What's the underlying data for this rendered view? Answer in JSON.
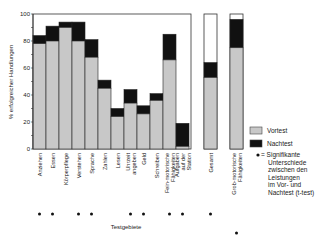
{
  "chart_data": {
    "type": "bar",
    "stacked": true,
    "title": "",
    "xlabel": "Testgebiete",
    "ylabel": "% erfolgreicher Handlungen",
    "ylim": [
      0,
      100
    ],
    "yticks": [
      0,
      20,
      40,
      60,
      80,
      100
    ],
    "grid": false,
    "categories": [
      {
        "label": [
          "Anziehen"
        ],
        "significant": true,
        "group": "main"
      },
      {
        "label": [
          "Essen"
        ],
        "significant": true,
        "group": "main"
      },
      {
        "label": [
          "Körperpflege"
        ],
        "significant": false,
        "group": "main"
      },
      {
        "label": [
          "Verstehen"
        ],
        "significant": true,
        "group": "main"
      },
      {
        "label": [
          "Sprache"
        ],
        "significant": true,
        "group": "main"
      },
      {
        "label": [
          "Zahlen"
        ],
        "significant": false,
        "group": "main"
      },
      {
        "label": [
          "Lesen"
        ],
        "significant": false,
        "group": "main"
      },
      {
        "label": [
          "Uhrzeit",
          "angeben"
        ],
        "significant": true,
        "group": "main"
      },
      {
        "label": [
          "Geld"
        ],
        "significant": true,
        "group": "main"
      },
      {
        "label": [
          "Schreiben"
        ],
        "significant": false,
        "group": "main"
      },
      {
        "label": [
          "Fein-motorische",
          "Fähigkeiten"
        ],
        "significant": true,
        "group": "main"
      },
      {
        "label": [
          "Aufgaben",
          "auf der",
          "Station"
        ],
        "significant": true,
        "group": "main"
      },
      {
        "label": [
          "Gesamt"
        ],
        "significant": true,
        "group": "gesamt"
      },
      {
        "label": [
          "Grob-motorische",
          "Fähigkeiten"
        ],
        "significant": true,
        "group": "grob"
      }
    ],
    "series": [
      {
        "name": "Vortest",
        "color": "#c8c8c8",
        "values": [
          78,
          80,
          90,
          80,
          68,
          45,
          24,
          34,
          26,
          36,
          66,
          2,
          53,
          75
        ]
      },
      {
        "name": "Nachtest",
        "color": "#111111",
        "values": [
          84,
          91,
          94,
          94,
          81,
          51,
          30,
          44,
          32,
          41,
          85,
          19,
          64,
          96
        ]
      }
    ],
    "legend": {
      "position": "right",
      "items": [
        {
          "name": "Vortest",
          "swatch": "#c8c8c8"
        },
        {
          "name": "Nachtest",
          "swatch": "#111111"
        }
      ],
      "note_marker": "•",
      "note_lines": [
        "= Signifikante",
        "Unterschiede",
        "zwischen den",
        "Leistungen",
        "im Vor- und",
        "Nachtest (t-test)"
      ]
    }
  }
}
